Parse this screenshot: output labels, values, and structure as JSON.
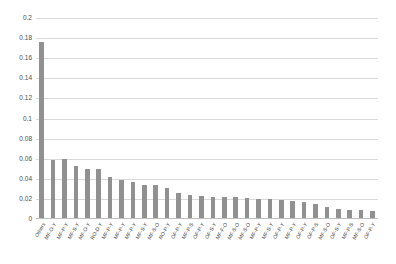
{
  "chart_data": {
    "type": "bar",
    "title": "",
    "xlabel": "",
    "ylabel": "",
    "ylim": [
      0,
      0.2
    ],
    "grid": true,
    "legend": "none",
    "bar_color": "#919191",
    "yticks": [
      "0",
      "0.02",
      "0.04",
      "0.06",
      "0.08",
      "0.1",
      "0.12",
      "0.14",
      "0.16",
      "0.18",
      "0.2"
    ],
    "ytick_values": [
      0,
      0.02,
      0.04,
      0.06,
      0.08,
      0.1,
      0.12,
      0.14,
      0.16,
      0.18,
      0.2
    ],
    "categories": [
      "Others",
      "MF-O-Y",
      "MF-P-Y",
      "MF-S-Y",
      "MF-O-Y",
      "RO-D-Y",
      "MF-P-Y",
      "MF-P-Y",
      "MF-P-Y",
      "MF-S-Y",
      "MF-S-O",
      "RO-P-Y",
      "OF-P-Y",
      "MF-P-S",
      "OF-P-Y",
      "OF-S-Y",
      "MF-F-O",
      "MF-S-O",
      "MF-S-O",
      "MF-P-Y",
      "MF-S-Y",
      "OF-P-Y",
      "MF-P-Y",
      "OF-P-Y",
      "OF-P-S",
      "MF-S-O",
      "OF-S-Y",
      "MF-P-S",
      "MF-S-O",
      "OF-P-Y"
    ],
    "values": [
      0.176,
      0.059,
      0.06,
      0.053,
      0.05,
      0.05,
      0.042,
      0.039,
      0.037,
      0.034,
      0.034,
      0.031,
      0.026,
      0.024,
      0.023,
      0.022,
      0.022,
      0.022,
      0.021,
      0.02,
      0.02,
      0.019,
      0.018,
      0.017,
      0.015,
      0.012,
      0.01,
      0.009,
      0.009,
      0.008
    ]
  }
}
